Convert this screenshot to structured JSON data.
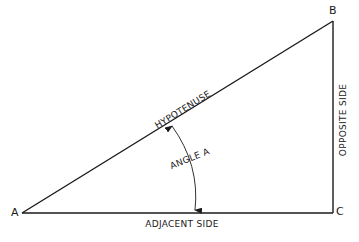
{
  "diagram": {
    "colors": {
      "line": "#1a1a1a",
      "background": "#ffffff"
    },
    "vertices": {
      "A": {
        "label": "A",
        "x": 22,
        "y": 213
      },
      "B": {
        "label": "B",
        "x": 333,
        "y": 21
      },
      "C": {
        "label": "C",
        "x": 333,
        "y": 213
      }
    },
    "sides": {
      "hypotenuse": "HYPOTENUSE",
      "opposite": "OPPOSITE SIDE",
      "adjacent": "ADJACENT SIDE"
    },
    "angle": {
      "label": "ANGLE A"
    }
  }
}
